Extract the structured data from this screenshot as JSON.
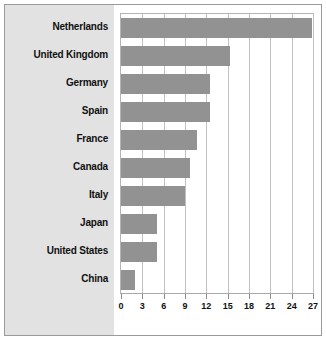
{
  "chart_data": {
    "type": "bar",
    "orientation": "horizontal",
    "title": "",
    "subtitle": "",
    "xlabel": "",
    "ylabel": "",
    "categories": [
      "Netherlands",
      "United Kingdom",
      "Germany",
      "Spain",
      "France",
      "Canada",
      "Italy",
      "Japan",
      "United States",
      "China"
    ],
    "values": [
      26.8,
      15.3,
      12.5,
      12.5,
      10.7,
      9.7,
      9.0,
      5.0,
      5.0,
      2.0
    ],
    "series": [
      {
        "name": "",
        "values": [
          26.8,
          15.3,
          12.5,
          12.5,
          10.7,
          9.7,
          9.0,
          5.0,
          5.0,
          2.0
        ]
      }
    ],
    "xlim": [
      0,
      27
    ],
    "xticks": [
      0,
      3,
      6,
      9,
      12,
      15,
      18,
      21,
      24,
      27
    ],
    "xtick_labels": [
      "0",
      "3",
      "6",
      "9",
      "12",
      "15",
      "18",
      "21",
      "24",
      "27"
    ],
    "grid": "vertical",
    "legend": "none",
    "bar_color": "#929292",
    "panel_color": "#e2e2e2",
    "plot_background": "#ffffff",
    "gridline_color": "#c0c0c0",
    "frame_color": "#9a9a9a"
  }
}
